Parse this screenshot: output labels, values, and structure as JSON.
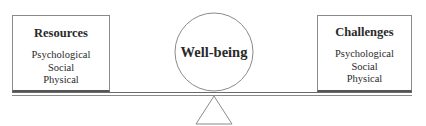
{
  "diagram": {
    "type": "balance-scale",
    "left": {
      "title": "Resources",
      "items": [
        "Psychological",
        "Social",
        "Physical"
      ]
    },
    "center": {
      "label": "Well-being"
    },
    "right": {
      "title": "Challenges",
      "items": [
        "Psychological",
        "Social",
        "Physical"
      ]
    },
    "colors": {
      "line": "#8a8a8a",
      "text": "#2a2a2a",
      "background": "#ffffff"
    }
  }
}
